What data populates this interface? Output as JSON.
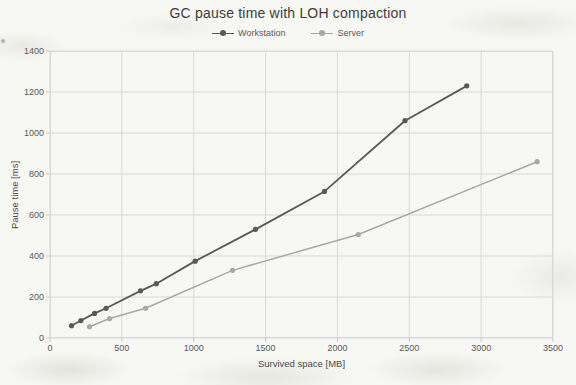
{
  "chart_data": {
    "type": "line",
    "title": "GC pause time with LOH compaction",
    "xlabel": "Survived space [MB]",
    "ylabel": "Pause time [ms]",
    "xlim": [
      0,
      3500
    ],
    "ylim": [
      0,
      1400
    ],
    "xticks": [
      0,
      500,
      1000,
      1500,
      2000,
      2500,
      3000,
      3500
    ],
    "yticks": [
      0,
      200,
      400,
      600,
      800,
      1000,
      1200,
      1400
    ],
    "grid": true,
    "legend_position": "top-center",
    "colors": {
      "grid": "#d9d9d9",
      "tick_mark": "#c9c9c9",
      "axis_text": "#595959",
      "title_text": "#3d3d3d"
    },
    "series": [
      {
        "name": "Workstation",
        "color": "#595959",
        "marker": "circle",
        "points": [
          [
            150,
            60
          ],
          [
            215,
            85
          ],
          [
            310,
            120
          ],
          [
            390,
            145
          ],
          [
            630,
            230
          ],
          [
            740,
            265
          ],
          [
            1010,
            375
          ],
          [
            1430,
            530
          ],
          [
            1910,
            715
          ],
          [
            2470,
            1060
          ],
          [
            2900,
            1230
          ]
        ]
      },
      {
        "name": "Server",
        "color": "#a8a8a6",
        "marker": "circle",
        "points": [
          [
            275,
            55
          ],
          [
            415,
            95
          ],
          [
            665,
            145
          ],
          [
            1270,
            330
          ],
          [
            2145,
            505
          ],
          [
            3390,
            860
          ]
        ]
      }
    ]
  }
}
